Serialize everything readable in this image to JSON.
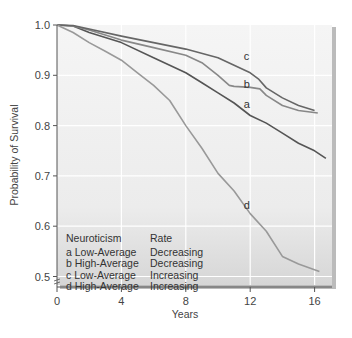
{
  "chart_data": {
    "type": "line",
    "title": "",
    "xlabel": "Years",
    "ylabel": "Probability of Survival",
    "xlim": [
      0,
      17
    ],
    "ylim": [
      0.48,
      1.0
    ],
    "x_ticks": [
      "0",
      "4",
      "8",
      "12",
      "16"
    ],
    "y_ticks": [
      "1.0",
      "0.9",
      "0.8",
      "0.7",
      "0.6",
      "0.5"
    ],
    "grid": true,
    "legend_position": "lower-left inside plot",
    "legend": {
      "header": [
        "Neuroticism",
        "Rate"
      ],
      "entries": [
        {
          "key": "a",
          "neuroticism": "Low-Average",
          "rate": "Decreasing"
        },
        {
          "key": "b",
          "neuroticism": "High-Average",
          "rate": "Decreasing"
        },
        {
          "key": "c",
          "neuroticism": "Low-Average",
          "rate": "Increasing"
        },
        {
          "key": "d",
          "neuroticism": "High-Average",
          "rate": "Increasing"
        }
      ]
    },
    "series": [
      {
        "name": "a",
        "color": "#555555",
        "x": [
          0,
          1,
          2,
          4,
          6,
          8,
          9,
          10,
          11,
          12,
          13,
          14,
          15,
          16,
          16.7
        ],
        "y": [
          1.0,
          0.998,
          0.985,
          0.965,
          0.935,
          0.905,
          0.885,
          0.865,
          0.845,
          0.82,
          0.805,
          0.785,
          0.765,
          0.75,
          0.735
        ]
      },
      {
        "name": "b",
        "color": "#888888",
        "x": [
          0,
          1,
          2,
          4,
          6,
          8,
          9,
          10,
          10.7,
          11,
          12,
          12.6,
          13,
          14,
          15,
          16.2
        ],
        "y": [
          1.0,
          0.998,
          0.99,
          0.97,
          0.955,
          0.94,
          0.925,
          0.9,
          0.88,
          0.878,
          0.876,
          0.873,
          0.86,
          0.84,
          0.83,
          0.825
        ]
      },
      {
        "name": "c",
        "color": "#666666",
        "x": [
          0,
          1,
          2,
          4,
          6,
          8,
          10,
          11,
          12,
          12.5,
          13,
          14,
          15,
          16
        ],
        "y": [
          1.0,
          0.999,
          0.992,
          0.978,
          0.965,
          0.952,
          0.935,
          0.92,
          0.905,
          0.893,
          0.875,
          0.855,
          0.84,
          0.83
        ]
      },
      {
        "name": "d",
        "color": "#999999",
        "x": [
          0,
          1,
          2,
          3,
          4,
          5,
          6,
          7,
          8,
          9,
          10,
          11,
          12,
          13,
          14,
          15,
          16.3
        ],
        "y": [
          1.0,
          0.985,
          0.965,
          0.948,
          0.93,
          0.905,
          0.88,
          0.85,
          0.8,
          0.755,
          0.705,
          0.67,
          0.625,
          0.59,
          0.54,
          0.525,
          0.51
        ]
      }
    ],
    "curve_labels": [
      {
        "key": "c",
        "x": 11.6,
        "y": 0.93
      },
      {
        "key": "b",
        "x": 11.6,
        "y": 0.875
      },
      {
        "key": "a",
        "x": 11.6,
        "y": 0.835
      },
      {
        "key": "d",
        "x": 11.6,
        "y": 0.635
      }
    ]
  },
  "legend": {
    "header_col1": "Neuroticism",
    "header_col2": "Rate",
    "rows": [
      {
        "col1": "a Low-Average",
        "col2": "Decreasing"
      },
      {
        "col1": "b High-Average",
        "col2": "Decreasing"
      },
      {
        "col1": "c Low-Average",
        "col2": "Increasing"
      },
      {
        "col1": "d High-Average",
        "col2": "Increasing"
      }
    ]
  },
  "axes": {
    "xlabel": "Years",
    "ylabel": "Probability of Survival"
  },
  "colors": {
    "plot_bg_top": "#f4f4f4",
    "plot_bg_bottom": "#dcdcdc",
    "grid": "#ffffff",
    "axis": "#555555"
  }
}
